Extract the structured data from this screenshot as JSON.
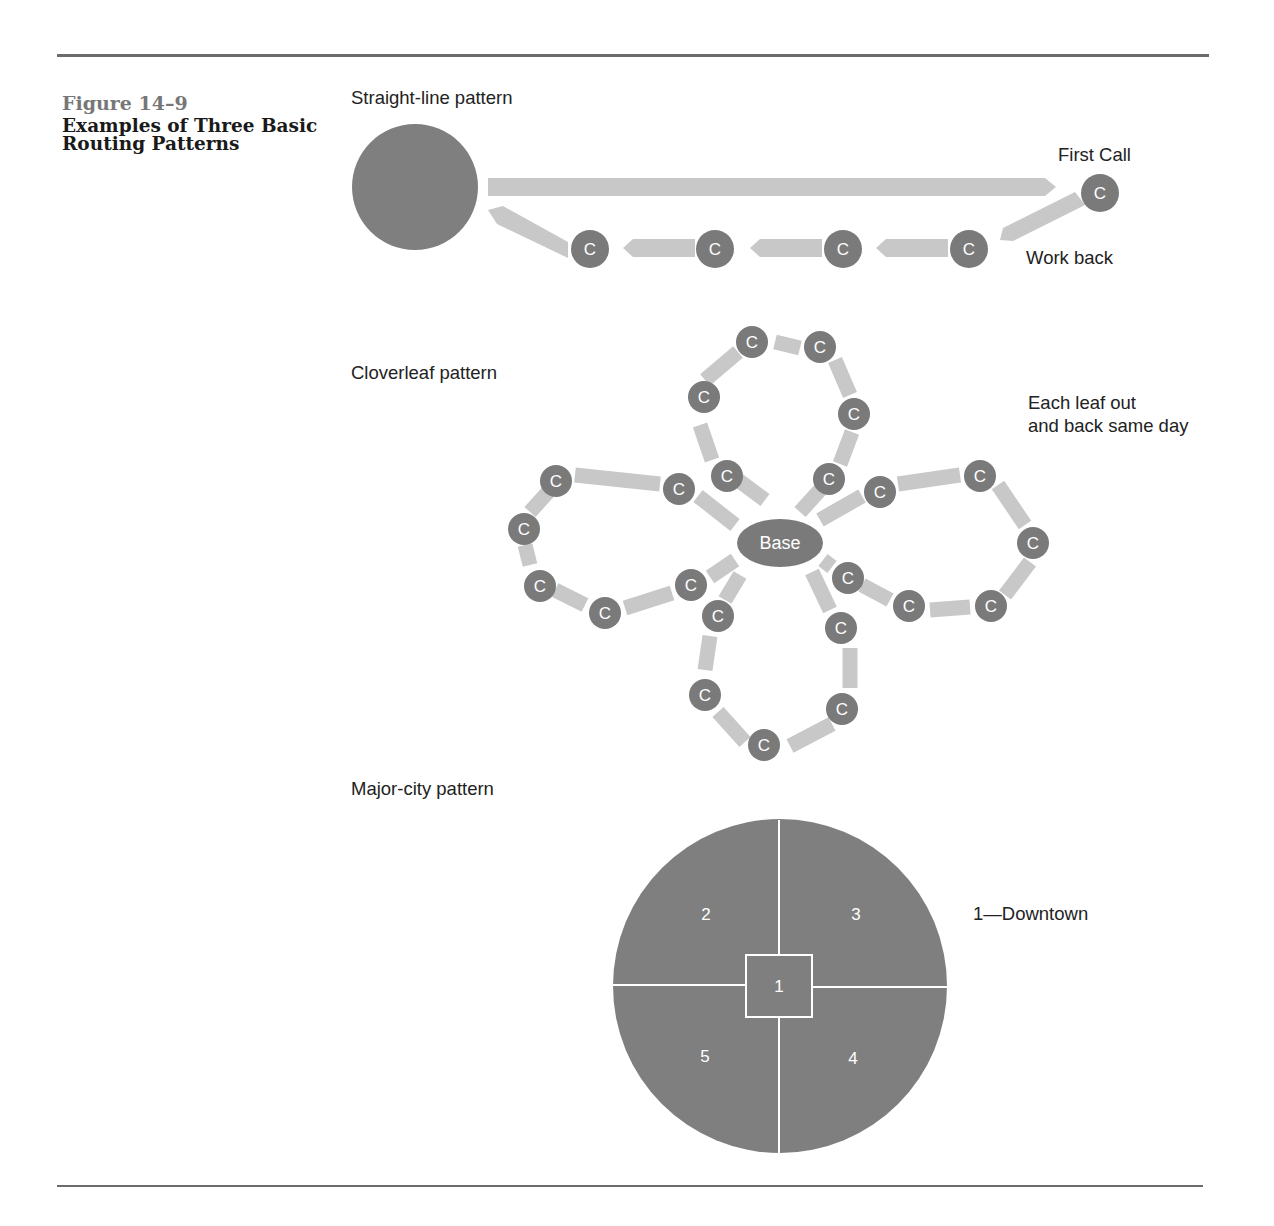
{
  "figure": {
    "number": "Figure 14–9",
    "title": "Examples of Three Basic Routing Patterns"
  },
  "colors": {
    "dark_gray": "#7a7a7a",
    "arrow_gray": "#c8c8c8",
    "text": "#222222",
    "rule": "#6b6b6b"
  },
  "patterns": {
    "straight_line": {
      "label": "Straight-line pattern",
      "first_call_label": "First Call",
      "work_back_label": "Work back",
      "call_glyph": "C"
    },
    "cloverleaf": {
      "label": "Cloverleaf pattern",
      "note_line1": "Each leaf out",
      "note_line2": "and back same day",
      "base_label": "Base",
      "call_glyph": "C"
    },
    "major_city": {
      "label": "Major-city pattern",
      "legend": "1—Downtown",
      "zones": [
        "1",
        "2",
        "3",
        "4",
        "5"
      ]
    }
  }
}
